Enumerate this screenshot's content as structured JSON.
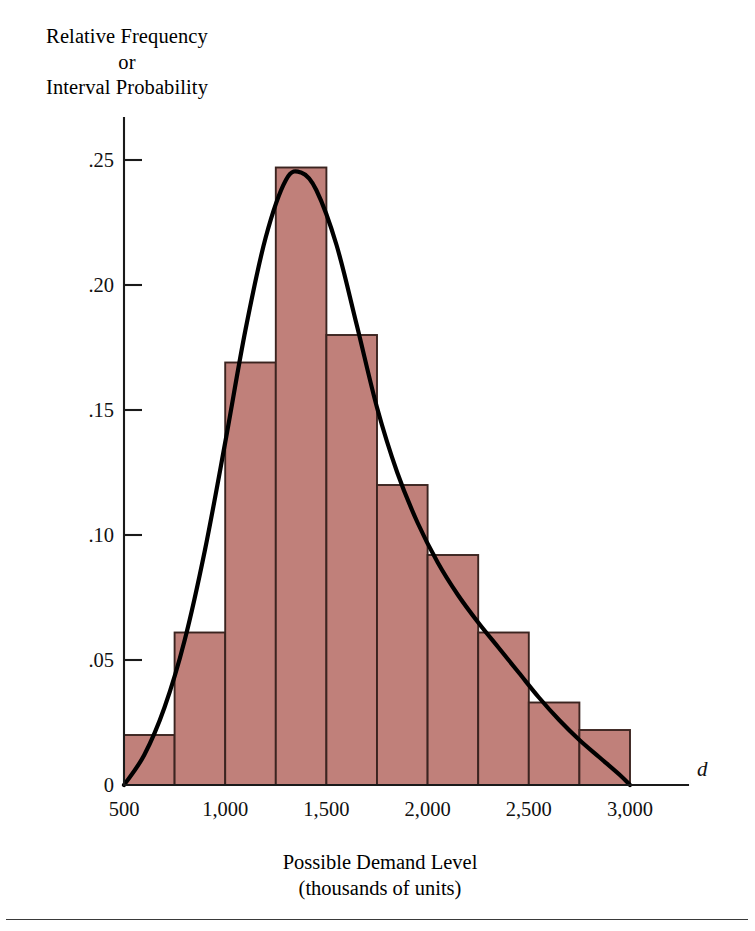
{
  "figure": {
    "name": "demand-level-histogram",
    "background_color": "#ffffff",
    "bar_fill_color": "#c0807a",
    "bar_border_color": "#3b2420",
    "curve_color": "#000000",
    "axis_color": "#1a1a1a"
  },
  "axis_labels": {
    "y_line1": "Relative Frequency",
    "y_line2": "or",
    "y_line3": "Interval Probability",
    "x_line1": "Possible Demand Level",
    "x_line2": "(thousands of units)",
    "x_variable": "d"
  },
  "ticks": {
    "y": [
      "0",
      ".05",
      ".10",
      ".15",
      ".20",
      ".25"
    ],
    "x": [
      "500",
      "1,000",
      "1,500",
      "2,000",
      "2,500",
      "3,000"
    ]
  },
  "chart_data": {
    "type": "bar",
    "title": "",
    "subtitle": "",
    "xlabel": "Possible Demand Level (thousands of units)",
    "ylabel": "Relative Frequency or Interval Probability",
    "xlim": [
      500,
      3000
    ],
    "ylim": [
      0,
      0.25
    ],
    "grid": false,
    "legend": "none",
    "x_tick_values": [
      500,
      1000,
      1500,
      2000,
      2500,
      3000
    ],
    "x_tick_labels": [
      "500",
      "1,000",
      "1,500",
      "2,000",
      "2,500",
      "3,000"
    ],
    "y_tick_values": [
      0,
      0.05,
      0.1,
      0.15,
      0.2,
      0.25
    ],
    "y_tick_labels": [
      "0",
      ".05",
      ".10",
      ".15",
      ".20",
      ".25"
    ],
    "bin_width": 250,
    "bin_edges": [
      500,
      750,
      1000,
      1250,
      1500,
      1750,
      2000,
      2250,
      2500,
      2750,
      3000
    ],
    "categories": [
      "500-750",
      "750-1,000",
      "1,000-1,250",
      "1,250-1,500",
      "1,500-1,750",
      "1,750-2,000",
      "2,000-2,250",
      "2,250-2,500",
      "2,500-2,750",
      "2,750-3,000"
    ],
    "values": [
      0.02,
      0.061,
      0.169,
      0.247,
      0.18,
      0.12,
      0.092,
      0.061,
      0.033,
      0.022
    ],
    "overlay_curve": {
      "name": "normal-approximation-curve",
      "type": "line",
      "peak_x": 1375,
      "peak_y": 0.245,
      "x_start": 500,
      "x_end": 3000,
      "points": [
        [
          500,
          0.0
        ],
        [
          600,
          0.012
        ],
        [
          700,
          0.031
        ],
        [
          800,
          0.058
        ],
        [
          900,
          0.094
        ],
        [
          1000,
          0.137
        ],
        [
          1100,
          0.182
        ],
        [
          1200,
          0.219
        ],
        [
          1300,
          0.242
        ],
        [
          1375,
          0.245
        ],
        [
          1450,
          0.238
        ],
        [
          1550,
          0.216
        ],
        [
          1650,
          0.184
        ],
        [
          1750,
          0.151
        ],
        [
          1850,
          0.125
        ],
        [
          1950,
          0.105
        ],
        [
          2050,
          0.089
        ],
        [
          2150,
          0.076
        ],
        [
          2250,
          0.065
        ],
        [
          2350,
          0.055
        ],
        [
          2450,
          0.045
        ],
        [
          2550,
          0.035
        ],
        [
          2650,
          0.026
        ],
        [
          2750,
          0.018
        ],
        [
          2850,
          0.011
        ],
        [
          2950,
          0.004
        ],
        [
          3000,
          0.0
        ]
      ]
    }
  }
}
